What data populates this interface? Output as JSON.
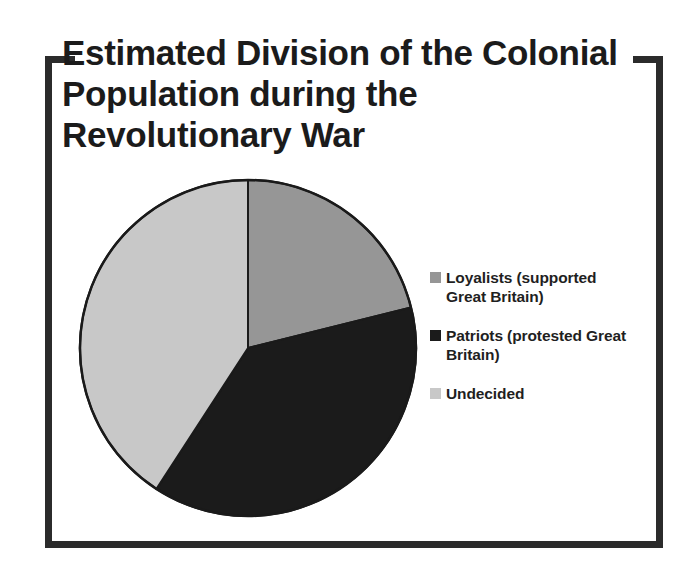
{
  "slide": {
    "background_color": "#ffffff",
    "frame_color": "#2b2b2b",
    "title": "Estimated Division of the Colonial Population during the Revolutionary War"
  },
  "chart_data": {
    "type": "pie",
    "title": "Estimated Division of the Colonial Population during the Revolutionary War",
    "categories": [
      "Loyalists (supported Great Britain)",
      "Patriots (protested Great Britain)",
      "Undecided"
    ],
    "values": [
      21,
      38,
      41
    ],
    "value_unit": "percent",
    "colors": [
      "#969696",
      "#1b1b1b",
      "#c8c8c8"
    ],
    "start_angle_deg": 0,
    "direction": "clockwise",
    "slice_boundaries_deg": [
      0,
      76,
      213,
      360
    ],
    "outline_color": "#1a1a1a",
    "data_labels_shown": false,
    "grid": false,
    "legend_position": "right",
    "legend": [
      {
        "label": "Loyalists (supported Great Britain)",
        "color": "#969696"
      },
      {
        "label": "Patriots (protested Great Britain)",
        "color": "#1b1b1b"
      },
      {
        "label": "Undecided",
        "color": "#c8c8c8"
      }
    ]
  },
  "legend": {
    "items": [
      {
        "label": "Loyalists (supported Great Britain)",
        "swatch_color": "#969696",
        "swatch_icon": "square-swatch-icon"
      },
      {
        "label": "Patriots (protested Great Britain)",
        "swatch_color": "#1b1b1b",
        "swatch_icon": "square-swatch-icon"
      },
      {
        "label": "Undecided",
        "swatch_color": "#c8c8c8",
        "swatch_icon": "square-swatch-icon"
      }
    ]
  }
}
